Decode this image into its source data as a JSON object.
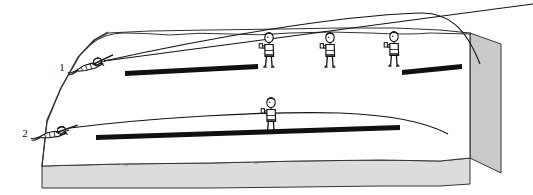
{
  "figure": {
    "caption": "",
    "background_color": "#ffffff",
    "ink_color": "#111111",
    "ground_top_fill": "#ffffff",
    "ground_front_fill": "#dcdcdc",
    "ground_side_fill": "#c9c9c9",
    "bar_color": "#111111"
  },
  "labels": {
    "scenario_1": "1",
    "scenario_2": "2"
  },
  "scenes": [
    {
      "id": "scene-1",
      "label": "1",
      "shooter": {
        "name": "prone-shooter-1",
        "pose": "prone",
        "x": 88,
        "y": 66,
        "muzzle_x": 104,
        "muzzle_y": 60
      },
      "trajectory": {
        "type": "high-arc",
        "description": "High arcing trajectory rising above the standing observers and descending beyond them",
        "start": [
          104,
          61
        ],
        "apex": [
          420,
          13
        ],
        "end": [
          478,
          62
        ],
        "rise_control": [
          250,
          22
        ],
        "fall_control": [
          462,
          20
        ]
      },
      "sight_line": {
        "description": "Straight line of sight from shooter to distant point",
        "start": [
          104,
          61
        ],
        "end": [
          533,
          5
        ]
      },
      "observers": [
        {
          "name": "standing-observer-1",
          "x": 268,
          "y": 35
        },
        {
          "name": "standing-observer-2",
          "x": 328,
          "y": 35
        },
        {
          "name": "standing-observer-3",
          "x": 392,
          "y": 35
        }
      ],
      "bars": [
        {
          "name": "black-bar-left",
          "x1": 125,
          "y1": 69,
          "x2": 258,
          "y2": 65,
          "thickness": 5
        },
        {
          "name": "black-bar-right",
          "x1": 402,
          "y1": 68,
          "x2": 462,
          "y2": 65,
          "thickness": 5
        }
      ],
      "ridge": {
        "description": "Undulating ground ridge line behind scene 1",
        "points": "60,44 78,36 110,34 150,36 200,34 250,33 300,34 350,33 400,33 440,34 470,35"
      }
    },
    {
      "id": "scene-2",
      "label": "2",
      "shooter": {
        "name": "prone-shooter-2",
        "pose": "prone",
        "x": 50,
        "y": 131,
        "muzzle_x": 68,
        "muzzle_y": 127
      },
      "trajectory": {
        "type": "flat-arc",
        "description": "Low flat trajectory passing just over one standing observer",
        "start": [
          68,
          128
        ],
        "apex": [
          330,
          113
        ],
        "end": [
          450,
          133
        ],
        "rise_control": [
          220,
          114
        ],
        "fall_control": [
          420,
          113
        ]
      },
      "observers": [
        {
          "name": "standing-observer-4",
          "x": 270,
          "y": 100
        }
      ],
      "bars": [
        {
          "name": "black-bar-lower",
          "x1": 96,
          "y1": 133,
          "x2": 400,
          "y2": 126,
          "thickness": 5
        }
      ]
    }
  ],
  "ground_block": {
    "name": "terrain-block",
    "top_outline": "5,168 10,120 34,74 62,42 78,33 120,31 200,29 300,28 380,27 440,30 470,33",
    "front_face_top": "5,168 70,166 160,163 260,162 360,160 430,160 470,158",
    "front_face_bottom_y": 184,
    "side_face": "470,33 500,42 500,172 470,158"
  },
  "figure_parts": {
    "head": "head",
    "torso": "torso",
    "arms": "arms",
    "legs": "legs",
    "rifle": "rifle"
  }
}
